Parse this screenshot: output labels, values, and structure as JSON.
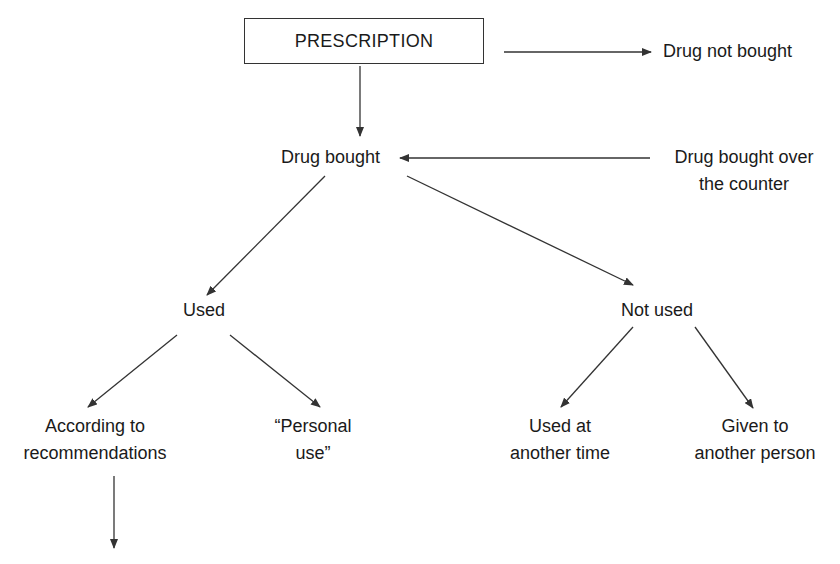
{
  "diagram": {
    "type": "flowchart",
    "root": {
      "id": "prescription",
      "label": "PRESCRIPTION",
      "boxed": true
    },
    "nodes": [
      {
        "id": "drug_not_bought",
        "lines": [
          "Drug not bought"
        ]
      },
      {
        "id": "drug_bought",
        "lines": [
          "Drug bought"
        ]
      },
      {
        "id": "otc",
        "lines": [
          "Drug bought over",
          "the counter"
        ]
      },
      {
        "id": "used",
        "lines": [
          "Used"
        ]
      },
      {
        "id": "not_used",
        "lines": [
          "Not used"
        ]
      },
      {
        "id": "according",
        "lines": [
          "According to",
          "recommendations"
        ]
      },
      {
        "id": "personal",
        "lines": [
          "“Personal",
          "use”"
        ]
      },
      {
        "id": "another_time",
        "lines": [
          "Used at",
          "another time"
        ]
      },
      {
        "id": "another_person",
        "lines": [
          "Given to",
          "another person"
        ]
      }
    ],
    "edges": [
      {
        "from": "prescription",
        "to": "drug_not_bought"
      },
      {
        "from": "prescription",
        "to": "drug_bought"
      },
      {
        "from": "otc",
        "to": "drug_bought"
      },
      {
        "from": "drug_bought",
        "to": "used"
      },
      {
        "from": "drug_bought",
        "to": "not_used"
      },
      {
        "from": "used",
        "to": "according"
      },
      {
        "from": "used",
        "to": "personal"
      },
      {
        "from": "not_used",
        "to": "another_time"
      },
      {
        "from": "not_used",
        "to": "another_person"
      },
      {
        "from": "according",
        "to": "(continues below, cut off)"
      }
    ],
    "line_color": "#333333"
  }
}
